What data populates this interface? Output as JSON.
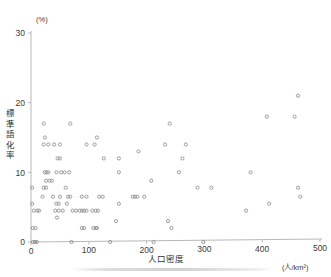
{
  "figure": {
    "kind": "scatter-plot",
    "y_unit_label": "(%)",
    "x_axis_title": "人口密度",
    "x_unit_label": "(人/km²)",
    "y_axis_title_chars": [
      "標",
      "準",
      "語",
      "化",
      "率"
    ],
    "y_axis_title": "標準語化率"
  },
  "chart_data": {
    "type": "scatter",
    "title": "",
    "xlabel": "人口密度",
    "ylabel": "標準語化率",
    "x_unit": "人/km²",
    "y_unit": "%",
    "xlim": [
      0,
      500
    ],
    "ylim": [
      0,
      30
    ],
    "xticks": [
      0,
      100,
      200,
      300,
      400,
      500
    ],
    "yticks": [
      0,
      10,
      20,
      30
    ],
    "grid": false,
    "legend": null,
    "marker": "open-circle",
    "marker_color": "#8c8c8c",
    "points": [
      [
        3,
        0
      ],
      [
        7,
        0
      ],
      [
        10,
        0
      ],
      [
        70,
        0
      ],
      [
        137,
        0
      ],
      [
        212,
        0
      ],
      [
        298,
        0
      ],
      [
        3,
        2
      ],
      [
        8,
        2
      ],
      [
        88,
        2
      ],
      [
        92,
        2
      ],
      [
        108,
        2
      ],
      [
        112,
        2
      ],
      [
        114,
        2
      ],
      [
        147,
        3
      ],
      [
        237,
        3
      ],
      [
        243,
        2
      ],
      [
        5,
        4.5
      ],
      [
        11,
        4.5
      ],
      [
        14,
        4.5
      ],
      [
        42,
        4.5
      ],
      [
        48,
        4.5
      ],
      [
        55,
        4.5
      ],
      [
        72,
        4.5
      ],
      [
        78,
        4.5
      ],
      [
        84,
        4.5
      ],
      [
        88,
        4.5
      ],
      [
        92,
        4.5
      ],
      [
        96,
        4.5
      ],
      [
        106,
        4.5
      ],
      [
        112,
        4.5
      ],
      [
        116,
        4.5
      ],
      [
        2,
        5.5
      ],
      [
        44,
        5.5
      ],
      [
        48,
        5.5
      ],
      [
        62,
        5.5
      ],
      [
        152,
        5.5
      ],
      [
        372,
        4.5
      ],
      [
        45,
        3.5
      ],
      [
        20,
        6.5
      ],
      [
        38,
        6.5
      ],
      [
        50,
        6.5
      ],
      [
        64,
        6.5
      ],
      [
        68,
        6.5
      ],
      [
        88,
        6.5
      ],
      [
        96,
        6.5
      ],
      [
        118,
        6.5
      ],
      [
        124,
        6.5
      ],
      [
        176,
        6.5
      ],
      [
        180,
        6.5
      ],
      [
        184,
        6.5
      ],
      [
        196,
        6.5
      ],
      [
        412,
        5.5
      ],
      [
        466,
        6.5
      ],
      [
        2,
        7.8
      ],
      [
        22,
        7.8
      ],
      [
        26,
        7.8
      ],
      [
        60,
        7.8
      ],
      [
        288,
        7.8
      ],
      [
        312,
        7.8
      ],
      [
        462,
        7.8
      ],
      [
        26,
        8.8
      ],
      [
        32,
        8.8
      ],
      [
        36,
        8.8
      ],
      [
        208,
        8.8
      ],
      [
        24,
        10
      ],
      [
        27,
        10
      ],
      [
        30,
        10
      ],
      [
        44,
        10
      ],
      [
        52,
        10
      ],
      [
        58,
        10
      ],
      [
        66,
        10
      ],
      [
        152,
        10
      ],
      [
        256,
        10
      ],
      [
        380,
        10
      ],
      [
        46,
        12
      ],
      [
        50,
        12
      ],
      [
        126,
        12
      ],
      [
        152,
        12
      ],
      [
        262,
        12
      ],
      [
        186,
        13
      ],
      [
        22,
        14
      ],
      [
        30,
        14
      ],
      [
        40,
        14
      ],
      [
        50,
        14
      ],
      [
        96,
        14
      ],
      [
        110,
        14
      ],
      [
        232,
        14
      ],
      [
        268,
        14
      ],
      [
        24,
        15
      ],
      [
        114,
        15
      ],
      [
        22,
        17
      ],
      [
        68,
        17
      ],
      [
        240,
        17
      ],
      [
        408,
        18
      ],
      [
        456,
        18
      ],
      [
        462,
        21
      ]
    ]
  }
}
